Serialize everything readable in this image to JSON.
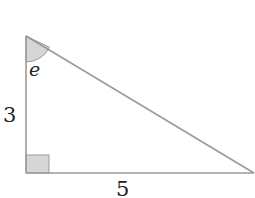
{
  "diagram": {
    "type": "right-triangle",
    "vertices": {
      "top": [
        26,
        36
      ],
      "right_angle": [
        26,
        173
      ],
      "right": [
        254,
        173
      ]
    },
    "sides": {
      "vertical": {
        "label": "3"
      },
      "horizontal": {
        "label": "5"
      }
    },
    "angle": {
      "label": "e",
      "at": "top"
    },
    "colors": {
      "stroke": "#9a9a9a",
      "fill_marker": "#d6d6d6",
      "text": "#222222"
    }
  }
}
